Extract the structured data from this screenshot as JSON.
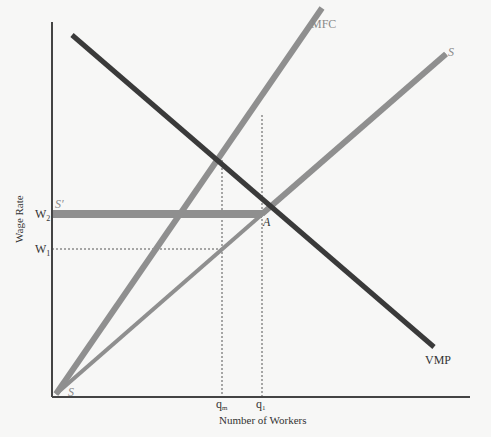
{
  "diagram": {
    "type": "monopsony labor market",
    "axes": {
      "ylabel": "Wage Rate",
      "xlabel": "Number of Workers"
    },
    "curves": {
      "mfc": {
        "label": "MFC",
        "color": "#8f8f8f"
      },
      "supply": {
        "label": "S",
        "color": "#8f8f8f"
      },
      "supply_origin": {
        "label": "S"
      },
      "supply_prime": {
        "label": "S′",
        "color": "#8f8f8f"
      },
      "vmp": {
        "label": "VMP",
        "color": "#3a3a3a"
      }
    },
    "y_ticks": {
      "w2": {
        "base": "W",
        "sub": "2"
      },
      "w1": {
        "base": "W",
        "sub": "1"
      }
    },
    "x_ticks": {
      "qm": {
        "base": "q",
        "sub": "m"
      },
      "q1": {
        "base": "q",
        "sub": "1"
      }
    },
    "points": {
      "a": {
        "label": "A"
      }
    },
    "colors": {
      "background": "#f7f7f6",
      "axis": "#444444",
      "light_curve": "#8f8f8f",
      "dark_curve": "#3a3a3a",
      "dotted": "#555555"
    }
  }
}
